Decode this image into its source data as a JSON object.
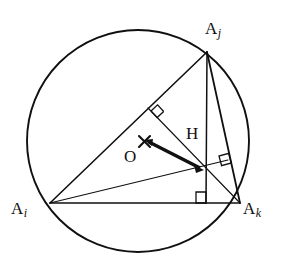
{
  "figure": {
    "name": "triangle-inscribed-in-circle-with-orthocenter",
    "stroke_color": "#101010",
    "background_color": "#ffffff"
  },
  "circle": {
    "name": "circumcircle",
    "center": {
      "x": 138,
      "y": 141
    },
    "radius": 111,
    "stroke_width": 1.9
  },
  "vertices": [
    {
      "id": "Aj",
      "label": "A",
      "subscript": "j",
      "x": 207,
      "y": 52
    },
    {
      "id": "Ai",
      "label": "A",
      "subscript": "i",
      "x": 50,
      "y": 203
    },
    {
      "id": "Ak",
      "label": "A",
      "subscript": "k",
      "x": 240,
      "y": 203
    }
  ],
  "points": [
    {
      "id": "O",
      "label": "O",
      "x": 144,
      "y": 141,
      "marker": "cross-x"
    },
    {
      "id": "H",
      "label": "H",
      "x": 205,
      "y": 171,
      "marker": "arrow-head"
    }
  ],
  "triangle_sides": [
    {
      "name": "side-Ai-Aj",
      "from": "Ai",
      "to": "Aj"
    },
    {
      "name": "side-Aj-Ak",
      "from": "Aj",
      "to": "Ak"
    },
    {
      "name": "side-Ai-Ak",
      "from": "Ai",
      "to": "Ak"
    }
  ],
  "altitudes": [
    {
      "name": "altitude-from-Aj",
      "from": {
        "x": 207,
        "y": 52
      },
      "to": {
        "x": 206,
        "y": 203
      }
    },
    {
      "name": "altitude-from-Ai",
      "from": {
        "x": 50,
        "y": 203
      },
      "to": {
        "x": 227,
        "y": 160
      }
    },
    {
      "name": "altitude-from-Ak",
      "from": {
        "x": 240,
        "y": 203
      },
      "to": {
        "x": 148,
        "y": 108
      }
    }
  ],
  "right_angle_marks": [
    {
      "name": "right-angle-foot-on-Ai-Aj",
      "x": 151,
      "y": 111,
      "rotation": -43
    },
    {
      "name": "right-angle-foot-on-Aj-Ak",
      "x": 224,
      "y": 162,
      "rotation": -15
    },
    {
      "name": "right-angle-foot-on-Ai-Ak",
      "x": 206,
      "y": 202,
      "rotation": 0
    }
  ],
  "vector": {
    "name": "vector-O-to-H",
    "from": {
      "x": 146,
      "y": 142
    },
    "to": {
      "x": 204,
      "y": 170
    },
    "stroke_width": 3.2,
    "arrow_heads": "both"
  }
}
